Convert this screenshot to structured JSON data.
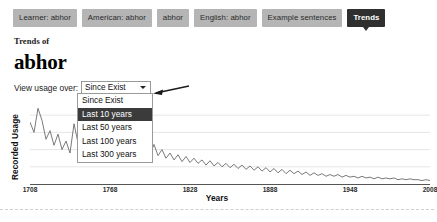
{
  "tabs": [
    {
      "label": "Learner: abhor",
      "active": false
    },
    {
      "label": "American: abhor",
      "active": false
    },
    {
      "label": "abhor",
      "active": false
    },
    {
      "label": "English: abhor",
      "active": false
    },
    {
      "label": "Example sentences",
      "active": false
    },
    {
      "label": "Trends",
      "active": true
    }
  ],
  "heading": {
    "kicker": "Trends of",
    "word": "abhor"
  },
  "control": {
    "label": "View usage over:",
    "selected": "Since Exist",
    "caret_icon": "chevron-down-icon",
    "annotation_icon": "left-arrow-annotation-icon",
    "options": [
      {
        "label": "Since Exist",
        "selected": false
      },
      {
        "label": "Last 10 years",
        "selected": true
      },
      {
        "label": "Last 50 years",
        "selected": false
      },
      {
        "label": "Last 100 years",
        "selected": false
      },
      {
        "label": "Last 300 years",
        "selected": false
      }
    ]
  },
  "colors": {
    "tab_inactive_bg": "#b5b5b5",
    "tab_active_bg": "#2f2f2f",
    "option_selected_bg": "#3b3b3b",
    "line": "#6b6b6b",
    "grid": "#e6e6e6"
  },
  "chart_data": {
    "type": "line",
    "title": "",
    "xlabel": "Years",
    "ylabel": "Recorded Usage",
    "xlim": [
      1708,
      2008
    ],
    "ylim": [
      0,
      100
    ],
    "grid": true,
    "legend": null,
    "xticks": [
      1708,
      1768,
      1828,
      1888,
      1948,
      2008
    ],
    "gridlines_y": [
      20,
      40,
      60,
      80
    ],
    "series": [
      {
        "name": "Recorded Usage",
        "x": [
          1708,
          1711,
          1714,
          1717,
          1720,
          1723,
          1726,
          1729,
          1732,
          1735,
          1738,
          1741,
          1744,
          1747,
          1750,
          1753,
          1756,
          1759,
          1762,
          1765,
          1768,
          1771,
          1774,
          1777,
          1780,
          1783,
          1786,
          1789,
          1792,
          1795,
          1798,
          1801,
          1804,
          1807,
          1810,
          1813,
          1816,
          1819,
          1822,
          1825,
          1828,
          1831,
          1834,
          1837,
          1840,
          1843,
          1846,
          1849,
          1852,
          1855,
          1858,
          1861,
          1864,
          1867,
          1870,
          1873,
          1876,
          1879,
          1882,
          1885,
          1888,
          1891,
          1894,
          1897,
          1900,
          1903,
          1906,
          1909,
          1912,
          1915,
          1918,
          1921,
          1924,
          1927,
          1930,
          1933,
          1936,
          1939,
          1942,
          1945,
          1948,
          1951,
          1954,
          1957,
          1960,
          1963,
          1966,
          1969,
          1972,
          1975,
          1978,
          1981,
          1984,
          1987,
          1990,
          1993,
          1996,
          1999,
          2002,
          2005,
          2008
        ],
        "y": [
          72,
          60,
          88,
          74,
          52,
          62,
          45,
          58,
          40,
          50,
          36,
          70,
          48,
          58,
          38,
          52,
          41,
          60,
          44,
          56,
          40,
          62,
          46,
          55,
          42,
          50,
          36,
          48,
          40,
          44,
          34,
          46,
          33,
          40,
          30,
          36,
          28,
          34,
          26,
          32,
          25,
          30,
          24,
          28,
          22,
          27,
          21,
          25,
          20,
          24,
          19,
          23,
          18,
          22,
          17,
          21,
          16,
          20,
          15,
          19,
          14,
          18,
          13,
          17,
          12,
          16,
          12,
          15,
          11,
          14,
          10,
          13,
          10,
          12,
          9,
          11,
          9,
          11,
          8,
          10,
          8,
          9,
          7,
          9,
          7,
          8,
          6,
          8,
          6,
          7,
          6,
          7,
          5,
          6,
          5,
          6,
          5,
          5,
          4,
          5,
          4
        ]
      }
    ]
  }
}
